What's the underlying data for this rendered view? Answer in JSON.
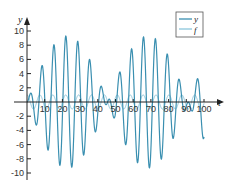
{
  "chart_data": {
    "type": "line",
    "title": "",
    "xlabel": "t",
    "ylabel": "y",
    "xlim": [
      0,
      100
    ],
    "ylim": [
      -10,
      10
    ],
    "grid": false,
    "legend_position": "upper right",
    "xticks": [
      10,
      20,
      30,
      40,
      50,
      60,
      70,
      80,
      90,
      100
    ],
    "yticks": [
      -10,
      -8,
      -6,
      -4,
      -2,
      2,
      4,
      6,
      8,
      10
    ],
    "series": [
      {
        "name": "y",
        "color": "#3a8fb0",
        "model": {
          "amplitude": 9.3,
          "envelope_freq": 0.069,
          "carrier_freq": 0.931
        },
        "description": "beating oscillation, envelope max ~9.3 near t=22 and t=68, near-zero envelope near t=45 and t=91",
        "x": [
          0,
          5,
          10,
          15,
          20,
          25,
          30,
          35,
          40,
          45,
          50,
          55,
          60,
          65,
          70,
          75,
          80,
          85,
          90,
          95,
          100
        ],
        "values": [
          0,
          -0.3,
          1.2,
          8.0,
          -1.8,
          -8.2,
          9.2,
          -2.0,
          -3.4,
          0.1,
          -0.3,
          3.3,
          -8.3,
          5.4,
          -1.0,
          -8.2,
          6.9,
          0.9,
          -0.1,
          0.5,
          -5.4
        ]
      },
      {
        "name": "f",
        "color": "#8cc6dc",
        "model": {
          "amplitude": 1.0,
          "freq": 0.862
        },
        "description": "forcing term, small oscillation of amplitude ~1 about 0",
        "x": [
          0,
          5,
          10,
          15,
          20,
          25,
          30,
          35,
          40,
          45,
          50,
          55,
          60,
          65,
          70,
          75,
          80,
          85,
          90,
          95,
          100
        ],
        "values": [
          1.0,
          -0.92,
          0.7,
          -0.38,
          -0.02,
          0.4,
          -0.72,
          0.93,
          -1.0,
          0.91,
          -0.67,
          0.33,
          0.06,
          -0.45,
          0.75,
          -0.95,
          1.0,
          -0.89,
          0.63,
          -0.29,
          -0.1
        ]
      }
    ]
  },
  "legend": {
    "items": [
      {
        "label": "y",
        "color": "#3a8fb0"
      },
      {
        "label": "f",
        "color": "#8cc6dc"
      }
    ]
  },
  "axes": {
    "x_label": "t",
    "y_label": "y",
    "x_tick_labels": [
      "10",
      "20",
      "30",
      "40",
      "50",
      "60",
      "70",
      "80",
      "90",
      "100"
    ],
    "y_tick_labels": [
      "10",
      "8",
      "6",
      "4",
      "2",
      "-2",
      "-4",
      "-6",
      "-8",
      "-10"
    ]
  }
}
